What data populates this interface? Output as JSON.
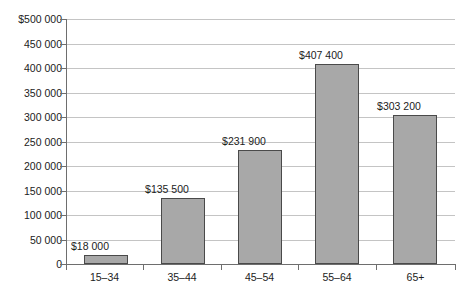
{
  "chart_data": {
    "type": "bar",
    "title": "",
    "subtitle": "",
    "xlabel": "",
    "ylabel": "",
    "categories": [
      "15–34",
      "35–44",
      "45–54",
      "55–64",
      "65+"
    ],
    "values": [
      18000,
      135500,
      231900,
      407400,
      303200
    ],
    "data_labels": [
      "$18 000",
      "$135 500",
      "$231 900",
      "$407 400",
      "$303 200"
    ],
    "ylim": [
      0,
      500000
    ],
    "ytick_values": [
      0,
      50000,
      100000,
      150000,
      200000,
      250000,
      300000,
      350000,
      400000,
      450000,
      500000
    ],
    "ytick_labels": [
      "0",
      "50 000",
      "100 000",
      "150 000",
      "200 000",
      "250 000",
      "300 000",
      "350 000",
      "400 000",
      "450 000",
      "$500 000"
    ],
    "grid": true,
    "grid_axis": "y",
    "legend": false,
    "legend_position": "none",
    "orientation": "vertical",
    "bar_fill_color": "#a8a8a8",
    "bar_border_color": "#4a4a4a",
    "gridline_color": "#c4c4c4",
    "axis_color": "#6e6e6e",
    "background_color": "#ffffff",
    "text_color": "#1c1c1c"
  }
}
